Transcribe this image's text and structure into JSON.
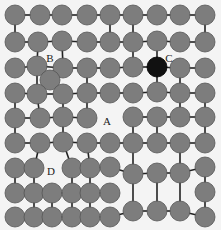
{
  "diagram": {
    "width": 221,
    "height": 230,
    "colors": {
      "background": "#f4f4f4",
      "node_fill": "#7d7d7d",
      "node_stroke": "#555555",
      "highlight_fill": "#111111",
      "edge": "#222222"
    },
    "node_radius": 10,
    "labels": [
      {
        "text": "B",
        "x": 50,
        "y": 59
      },
      {
        "text": "C",
        "x": 169,
        "y": 59
      },
      {
        "text": "A",
        "x": 107,
        "y": 122
      },
      {
        "text": "D",
        "x": 51,
        "y": 172
      }
    ],
    "nodes": [
      {
        "id": "r1c1",
        "x": 15,
        "y": 15
      },
      {
        "id": "r1c2",
        "x": 40,
        "y": 15
      },
      {
        "id": "r1c3",
        "x": 62,
        "y": 15
      },
      {
        "id": "r1c4",
        "x": 87,
        "y": 15
      },
      {
        "id": "r1c5",
        "x": 110,
        "y": 15
      },
      {
        "id": "r1c6",
        "x": 133,
        "y": 15
      },
      {
        "id": "r1c7",
        "x": 157,
        "y": 15
      },
      {
        "id": "r1c8",
        "x": 180,
        "y": 15
      },
      {
        "id": "r1c9",
        "x": 205,
        "y": 15
      },
      {
        "id": "r2c1",
        "x": 15,
        "y": 42
      },
      {
        "id": "r2c2",
        "x": 38,
        "y": 42
      },
      {
        "id": "r2c3",
        "x": 62,
        "y": 41
      },
      {
        "id": "r2c4",
        "x": 87,
        "y": 42
      },
      {
        "id": "r2c5",
        "x": 110,
        "y": 42
      },
      {
        "id": "r2c6",
        "x": 133,
        "y": 42
      },
      {
        "id": "r2c7",
        "x": 157,
        "y": 41
      },
      {
        "id": "r2c8",
        "x": 180,
        "y": 42
      },
      {
        "id": "r2c9",
        "x": 205,
        "y": 42
      },
      {
        "id": "r3c1",
        "x": 15,
        "y": 68
      },
      {
        "id": "r3c2",
        "x": 37,
        "y": 66
      },
      {
        "id": "r3c3",
        "x": 63,
        "y": 68
      },
      {
        "id": "r3c4",
        "x": 87,
        "y": 68
      },
      {
        "id": "r3c5",
        "x": 110,
        "y": 68
      },
      {
        "id": "r3c6",
        "x": 133,
        "y": 67
      },
      {
        "id": "r3c7",
        "x": 157,
        "y": 67,
        "highlight": true
      },
      {
        "id": "r3c8",
        "x": 180,
        "y": 68
      },
      {
        "id": "r3c9",
        "x": 205,
        "y": 68
      },
      {
        "id": "iso",
        "x": 50,
        "y": 80
      },
      {
        "id": "r4c1",
        "x": 15,
        "y": 93
      },
      {
        "id": "r4c2",
        "x": 37,
        "y": 94
      },
      {
        "id": "r4c3",
        "x": 63,
        "y": 94
      },
      {
        "id": "r4c4",
        "x": 87,
        "y": 93
      },
      {
        "id": "r4c5",
        "x": 110,
        "y": 93
      },
      {
        "id": "r4c6",
        "x": 133,
        "y": 93
      },
      {
        "id": "r4c7",
        "x": 157,
        "y": 92
      },
      {
        "id": "r4c8",
        "x": 180,
        "y": 93
      },
      {
        "id": "r4c9",
        "x": 205,
        "y": 93
      },
      {
        "id": "r5c1",
        "x": 15,
        "y": 118
      },
      {
        "id": "r5c2",
        "x": 40,
        "y": 118
      },
      {
        "id": "r5c3",
        "x": 63,
        "y": 117
      },
      {
        "id": "r5c4",
        "x": 87,
        "y": 118
      },
      {
        "id": "r5c6",
        "x": 133,
        "y": 117
      },
      {
        "id": "r5c7",
        "x": 157,
        "y": 117
      },
      {
        "id": "r5c8",
        "x": 180,
        "y": 117
      },
      {
        "id": "r5c9",
        "x": 205,
        "y": 117
      },
      {
        "id": "r6c1",
        "x": 15,
        "y": 143
      },
      {
        "id": "r6c2",
        "x": 40,
        "y": 143
      },
      {
        "id": "r6c3",
        "x": 63,
        "y": 142
      },
      {
        "id": "r6c4",
        "x": 87,
        "y": 143
      },
      {
        "id": "r6c5",
        "x": 110,
        "y": 143
      },
      {
        "id": "r6c6",
        "x": 133,
        "y": 143
      },
      {
        "id": "r6c7",
        "x": 157,
        "y": 143
      },
      {
        "id": "r6c8",
        "x": 180,
        "y": 143
      },
      {
        "id": "r6c9",
        "x": 205,
        "y": 143
      },
      {
        "id": "r7c1",
        "x": 15,
        "y": 168
      },
      {
        "id": "r7c2",
        "x": 34,
        "y": 168
      },
      {
        "id": "r7c3",
        "x": 72,
        "y": 168
      },
      {
        "id": "r7c4",
        "x": 90,
        "y": 168
      },
      {
        "id": "r7c5",
        "x": 110,
        "y": 167
      },
      {
        "id": "r7c6",
        "x": 133,
        "y": 174
      },
      {
        "id": "r7c7",
        "x": 157,
        "y": 173
      },
      {
        "id": "r7c8",
        "x": 180,
        "y": 173
      },
      {
        "id": "r7c9",
        "x": 205,
        "y": 167
      },
      {
        "id": "r8c1",
        "x": 15,
        "y": 193
      },
      {
        "id": "r8c2",
        "x": 34,
        "y": 193
      },
      {
        "id": "r8c3",
        "x": 52,
        "y": 193
      },
      {
        "id": "r8c4",
        "x": 72,
        "y": 193
      },
      {
        "id": "r8c5",
        "x": 90,
        "y": 193
      },
      {
        "id": "r8c6",
        "x": 110,
        "y": 193
      },
      {
        "id": "r8c9",
        "x": 205,
        "y": 192
      },
      {
        "id": "r9c1",
        "x": 15,
        "y": 217
      },
      {
        "id": "r9c2",
        "x": 34,
        "y": 217
      },
      {
        "id": "r9c3",
        "x": 52,
        "y": 217
      },
      {
        "id": "r9c4",
        "x": 72,
        "y": 217
      },
      {
        "id": "r9c5",
        "x": 90,
        "y": 217
      },
      {
        "id": "r9c6",
        "x": 110,
        "y": 217
      },
      {
        "id": "r9c7",
        "x": 133,
        "y": 211
      },
      {
        "id": "r9c8",
        "x": 157,
        "y": 211
      },
      {
        "id": "r9c9",
        "x": 180,
        "y": 211
      },
      {
        "id": "r9c10",
        "x": 205,
        "y": 217
      }
    ],
    "edges": [
      [
        "r1c1",
        "r1c2"
      ],
      [
        "r1c2",
        "r1c3"
      ],
      [
        "r1c3",
        "r1c4"
      ],
      [
        "r1c4",
        "r1c5"
      ],
      [
        "r1c5",
        "r1c6"
      ],
      [
        "r1c6",
        "r1c7"
      ],
      [
        "r1c7",
        "r1c8"
      ],
      [
        "r1c8",
        "r1c9"
      ],
      [
        "r1c1",
        "r2c1"
      ],
      [
        "r1c5",
        "r2c5"
      ],
      [
        "r1c6",
        "r2c6"
      ],
      [
        "r1c9",
        "r2c9"
      ],
      [
        "r2c1",
        "r2c2"
      ],
      [
        "r2c2",
        "r2c3"
      ],
      [
        "r2c3",
        "r2c4"
      ],
      [
        "r2c4",
        "r2c5"
      ],
      [
        "r2c5",
        "r2c6"
      ],
      [
        "r2c6",
        "r2c7"
      ],
      [
        "r2c7",
        "r2c8"
      ],
      [
        "r2c8",
        "r2c9"
      ],
      [
        "r2c2",
        "r3c2"
      ],
      [
        "r2c3",
        "r3c3"
      ],
      [
        "r2c6",
        "r3c6"
      ],
      [
        "r2c7",
        "r3c7"
      ],
      [
        "r3c1",
        "r3c2"
      ],
      [
        "r3c2",
        "r3c3"
      ],
      [
        "r3c3",
        "r3c4"
      ],
      [
        "r3c4",
        "r3c5"
      ],
      [
        "r3c5",
        "r3c6"
      ],
      [
        "r3c6",
        "r3c7"
      ],
      [
        "r3c7",
        "r3c8"
      ],
      [
        "r3c8",
        "r3c9"
      ],
      [
        "r3c2",
        "r4c2"
      ],
      [
        "r3c4",
        "r4c4"
      ],
      [
        "r3c7",
        "r4c7"
      ],
      [
        "r3c8",
        "r4c8"
      ],
      [
        "r4c1",
        "r4c2"
      ],
      [
        "r4c2",
        "r4c3"
      ],
      [
        "r4c3",
        "r4c4"
      ],
      [
        "r4c4",
        "r4c5"
      ],
      [
        "r4c5",
        "r4c6"
      ],
      [
        "r4c6",
        "r4c7"
      ],
      [
        "r4c7",
        "r4c8"
      ],
      [
        "r4c8",
        "r4c9"
      ],
      [
        "r4c1",
        "r5c1"
      ],
      [
        "r4c2",
        "r5c2"
      ],
      [
        "r4c3",
        "r5c3"
      ],
      [
        "r4c4",
        "r5c4"
      ],
      [
        "r4c8",
        "r5c8"
      ],
      [
        "r4c9",
        "r5c9"
      ],
      [
        "r5c1",
        "r5c2"
      ],
      [
        "r5c2",
        "r5c3"
      ],
      [
        "r5c3",
        "r5c4"
      ],
      [
        "r5c6",
        "r5c7"
      ],
      [
        "r5c7",
        "r5c8"
      ],
      [
        "r5c8",
        "r5c9"
      ],
      [
        "r5c1",
        "r6c1"
      ],
      [
        "r5c3",
        "r6c3"
      ],
      [
        "r5c6",
        "r6c6"
      ],
      [
        "r5c7",
        "r6c7"
      ],
      [
        "r5c9",
        "r6c9"
      ],
      [
        "r6c1",
        "r6c2"
      ],
      [
        "r6c2",
        "r6c3"
      ],
      [
        "r6c3",
        "r6c4"
      ],
      [
        "r6c4",
        "r6c5"
      ],
      [
        "r6c5",
        "r6c6"
      ],
      [
        "r6c6",
        "r6c7"
      ],
      [
        "r6c7",
        "r6c8"
      ],
      [
        "r6c8",
        "r6c9"
      ],
      [
        "r6c2",
        "r7c2"
      ],
      [
        "r6c3",
        "r7c3"
      ],
      [
        "r6c4",
        "r7c4"
      ],
      [
        "r6c6",
        "r7c6"
      ],
      [
        "r6c8",
        "r7c8"
      ],
      [
        "r7c1",
        "r7c2"
      ],
      [
        "r7c3",
        "r7c4"
      ],
      [
        "r7c4",
        "r7c5"
      ],
      [
        "r7c5",
        "r7c6"
      ],
      [
        "r7c6",
        "r7c7"
      ],
      [
        "r7c7",
        "r7c8"
      ],
      [
        "r7c8",
        "r7c9"
      ],
      [
        "r7c1",
        "r8c1"
      ],
      [
        "r7c2",
        "r8c2"
      ],
      [
        "r7c3",
        "r8c4"
      ],
      [
        "r7c4",
        "r8c5"
      ],
      [
        "r7c6",
        "r9c7"
      ],
      [
        "r7c7",
        "r9c8"
      ],
      [
        "r7c8",
        "r9c9"
      ],
      [
        "r7c9",
        "r8c9"
      ],
      [
        "r8c1",
        "r8c2"
      ],
      [
        "r8c2",
        "r8c3"
      ],
      [
        "r8c3",
        "r8c4"
      ],
      [
        "r8c4",
        "r8c5"
      ],
      [
        "r8c5",
        "r8c6"
      ],
      [
        "r8c2",
        "r9c2"
      ],
      [
        "r8c3",
        "r9c3"
      ],
      [
        "r8c4",
        "r9c4"
      ],
      [
        "r8c5",
        "r9c5"
      ],
      [
        "r8c9",
        "r9c10"
      ],
      [
        "r9c1",
        "r9c2"
      ],
      [
        "r9c2",
        "r9c3"
      ],
      [
        "r9c3",
        "r9c4"
      ],
      [
        "r9c4",
        "r9c5"
      ],
      [
        "r9c5",
        "r9c6"
      ],
      [
        "r9c6",
        "r9c7"
      ],
      [
        "r9c7",
        "r9c8"
      ],
      [
        "r9c8",
        "r9c9"
      ],
      [
        "r9c9",
        "r9c10"
      ]
    ]
  }
}
